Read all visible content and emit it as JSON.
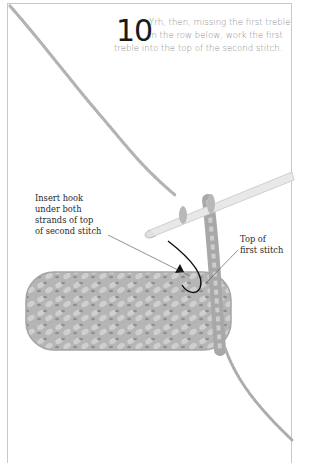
{
  "step": {
    "number": "10",
    "text_lines": [
      "Yrh, then, missing the first treble",
      "in the row below, work the first",
      "treble into the top of the second stitch."
    ]
  },
  "annotations": {
    "insert_hook": {
      "lines": [
        "Insert hook",
        "under both",
        "strands of top",
        "of second stitch"
      ]
    },
    "top_of_first_stitch": {
      "lines": [
        "Top of",
        "first stitch"
      ]
    }
  },
  "illustration": {
    "subject": "crochet swatch with hook inserted",
    "colors": {
      "yarn": "#b3b3b3",
      "yarn_shadow": "#8f8f8f",
      "hook": "#e6e6e6",
      "arrow": "#111111",
      "frame": "#c8c8c8"
    }
  }
}
